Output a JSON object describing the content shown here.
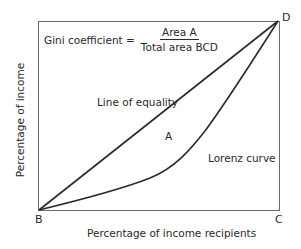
{
  "diagram": {
    "type": "lorenz-curve",
    "formula": {
      "lhs": "Gini coefficient =",
      "numerator": "Area A",
      "denominator": "Total area BCD"
    },
    "labels": {
      "line_of_equality": "Line of equality",
      "area": "A",
      "lorenz_curve": "Lorenz curve"
    },
    "corners": {
      "b": "B",
      "c": "C",
      "d": "D"
    },
    "axes": {
      "x_label": "Percentage of income recipients",
      "y_label": "Percentage of income"
    },
    "colors": {
      "line": "#2a2a2a",
      "box": "#6b6b6b",
      "background": "#ffffff"
    }
  }
}
